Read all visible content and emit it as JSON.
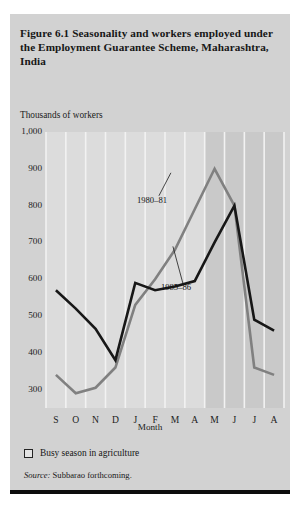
{
  "figure": {
    "title": "Figure 6.1  Seasonality and workers employed under the Employment Guarantee Scheme, Maharashtra, India",
    "y_axis_caption": "Thousands of workers",
    "legend_label": "Busy season in agriculture",
    "source_label": "Source:",
    "source_text": "Subbarao forthcoming."
  },
  "colors": {
    "panel_background": "#d2d2d2",
    "busy_band": "#dcdcdc",
    "plot_background": "#c9c9c9",
    "gridline": "#f2f2f2",
    "series_1980_81": "#808080",
    "series_1985_86": "#171717",
    "rule": "#0d0d0d"
  },
  "chart_data": {
    "type": "line",
    "title": "Figure 6.1  Seasonality and workers employed under the Employment Guarantee Scheme, Maharashtra, India",
    "xlabel": "Month",
    "ylabel": "Thousands of workers",
    "categories": [
      "S",
      "O",
      "N",
      "D",
      "J",
      "F",
      "M",
      "A",
      "M",
      "J",
      "J",
      "A"
    ],
    "ylim": [
      250,
      1000
    ],
    "yticks": [
      300,
      400,
      500,
      600,
      700,
      800,
      900,
      1000
    ],
    "ytick_labels": [
      "300",
      "400",
      "500",
      "600",
      "700",
      "800",
      "900",
      "1,000"
    ],
    "grid": true,
    "legend_position": "annotation",
    "series": [
      {
        "name": "1980-81",
        "label": "1980–81",
        "color": "#808080",
        "values": [
          340,
          290,
          305,
          360,
          530,
          600,
          680,
          790,
          900,
          800,
          360,
          340
        ]
      },
      {
        "name": "1985-86",
        "label": "1985–86",
        "color": "#171717",
        "values": [
          570,
          520,
          465,
          380,
          590,
          570,
          580,
          595,
          700,
          800,
          490,
          460
        ]
      }
    ],
    "annotations": [
      {
        "text": "1980–81",
        "attach_category": "M",
        "attach_value": 900
      },
      {
        "text": "1985–86",
        "attach_category": "M",
        "attach_value": 700
      }
    ],
    "shaded_bands": [
      {
        "label": "Busy season in agriculture",
        "from": "S",
        "to": "D",
        "shade": "light"
      },
      {
        "label": "Busy season in agriculture",
        "from": "J",
        "to": "A",
        "shade": "light"
      }
    ]
  }
}
